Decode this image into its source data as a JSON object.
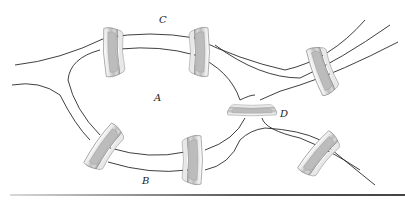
{
  "labels": {
    "A": "A",
    "B": "B",
    "C": "C",
    "D": "D"
  },
  "bridges": [
    {
      "id": "bridge-1",
      "connects": [
        "C",
        "A"
      ],
      "position": "top-left"
    },
    {
      "id": "bridge-2",
      "connects": [
        "C",
        "A"
      ],
      "position": "top-middle"
    },
    {
      "id": "bridge-3",
      "connects": [
        "C",
        "D"
      ],
      "position": "top-right"
    },
    {
      "id": "bridge-4",
      "connects": [
        "A",
        "D"
      ],
      "position": "center-right"
    },
    {
      "id": "bridge-5",
      "connects": [
        "B",
        "A"
      ],
      "position": "bottom-left"
    },
    {
      "id": "bridge-6",
      "connects": [
        "B",
        "A"
      ],
      "position": "bottom-middle"
    },
    {
      "id": "bridge-7",
      "connects": [
        "B",
        "D"
      ],
      "position": "bottom-right"
    }
  ],
  "colors": {
    "line": "#2a2a2a",
    "bridge_light": "#f2f2f2",
    "bridge_mid": "#c8c8c8",
    "bridge_dark": "#8a8a8a"
  }
}
